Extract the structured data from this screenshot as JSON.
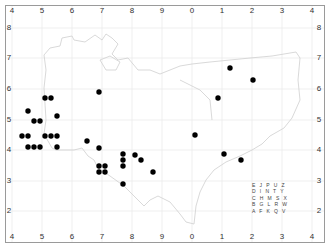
{
  "map": {
    "x_axis": {
      "labels": [
        "4",
        "5",
        "6",
        "7",
        "8",
        "9",
        "0",
        "1",
        "2",
        "3",
        "4"
      ],
      "positions": [
        12,
        42,
        72,
        102,
        132,
        162,
        192,
        222,
        252,
        282,
        312
      ]
    },
    "y_axis": {
      "labels": [
        "8",
        "7",
        "6",
        "5",
        "4",
        "3",
        "2"
      ],
      "positions": [
        28,
        58,
        89,
        120,
        150,
        181,
        211
      ]
    },
    "corner_labels": {
      "top_left": "4",
      "top_right": "4",
      "bottom_left": "4",
      "bottom_right": "4"
    },
    "gridline_color": "#e8e8e8",
    "coastline_color": "#cfcfcf",
    "dot_color": "#000000",
    "dots": [
      [
        28,
        111
      ],
      [
        34,
        121
      ],
      [
        40,
        121
      ],
      [
        45,
        98
      ],
      [
        51,
        98
      ],
      [
        57,
        116
      ],
      [
        22,
        136
      ],
      [
        28,
        136
      ],
      [
        45,
        136
      ],
      [
        51,
        136
      ],
      [
        57,
        136
      ],
      [
        28,
        147
      ],
      [
        34,
        147
      ],
      [
        40,
        147
      ],
      [
        57,
        147
      ],
      [
        99,
        92
      ],
      [
        87,
        141
      ],
      [
        99,
        148
      ],
      [
        99,
        166
      ],
      [
        105,
        166
      ],
      [
        99,
        172
      ],
      [
        105,
        172
      ],
      [
        123,
        154
      ],
      [
        123,
        160
      ],
      [
        123,
        166
      ],
      [
        123,
        184
      ],
      [
        135,
        155
      ],
      [
        141,
        160
      ],
      [
        153,
        172
      ],
      [
        230,
        68
      ],
      [
        253,
        80
      ],
      [
        218,
        98
      ],
      [
        195,
        135
      ],
      [
        224,
        154
      ],
      [
        241,
        160
      ]
    ],
    "legend_grid": {
      "rows": [
        "E J P U Z",
        "D I N T Y",
        "C H M S X",
        "B G L R W",
        "A F K Q V"
      ]
    }
  }
}
